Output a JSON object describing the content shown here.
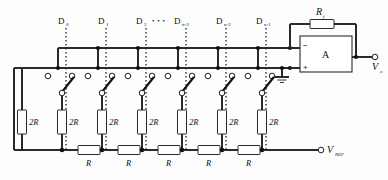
{
  "diagram": {
    "type": "circuit-schematic"
  },
  "digital_inputs": {
    "label_base": "D",
    "items": [
      {
        "base": "D",
        "sub": "0",
        "x": 62
      },
      {
        "base": "D",
        "sub": "1",
        "x": 102
      },
      {
        "base": "D",
        "sub": "2",
        "x": 140
      },
      {
        "base": "D",
        "sub": "n-3",
        "x": 180
      },
      {
        "base": "D",
        "sub": "n-2",
        "x": 222
      },
      {
        "base": "D",
        "sub": "n-1",
        "x": 262
      }
    ],
    "ellipsis": "• • •"
  },
  "ladder": {
    "series_resistors": [
      {
        "label": "R",
        "x": 97
      },
      {
        "label": "R",
        "x": 137
      },
      {
        "label": "R",
        "x": 177
      },
      {
        "label": "R",
        "x": 217
      },
      {
        "label": "R",
        "x": 257
      }
    ],
    "shunt_resistors": [
      {
        "label": "2R",
        "x": 22
      },
      {
        "label": "2R",
        "x": 62
      },
      {
        "label": "2R",
        "x": 102
      },
      {
        "label": "2R",
        "x": 142
      },
      {
        "label": "2R",
        "x": 182
      },
      {
        "label": "2R",
        "x": 222
      },
      {
        "label": "2R",
        "x": 262
      }
    ]
  },
  "feedback": {
    "label_base": "R",
    "label_sub": "f"
  },
  "opamp": {
    "symbol": "A",
    "minus": "−",
    "plus": "+"
  },
  "outputs": {
    "vout_base": "V",
    "vout_sub": "o"
  },
  "reference": {
    "vref_base": "V",
    "vref_sub": "REF"
  }
}
